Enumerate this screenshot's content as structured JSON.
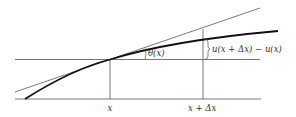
{
  "diagram": {
    "type": "function-increment-tangent-angle",
    "labels": {
      "x_point": "x",
      "x_delta_point": "x + Δx",
      "angle": "θ(x)",
      "increment": "u(x + Δx) − u(x)"
    },
    "elements": {
      "baseline": "horizontal axis",
      "reference_line": "horizontal line through (x, u(x))",
      "tangent_line": "tangent to curve at x",
      "curve": "u(x)",
      "vertical_at_x": "vertical line at x",
      "vertical_at_x_delta": "vertical line at x + Δx"
    },
    "colors": {
      "line": "#555555",
      "curve": "#111111",
      "text": "#333333"
    }
  }
}
